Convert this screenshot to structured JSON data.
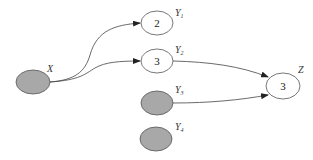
{
  "diagram": {
    "nodes": [
      {
        "id": "X",
        "label": "X",
        "sub": "",
        "value": "",
        "observed": true,
        "cx": 33,
        "cy": 82,
        "rx": 17,
        "ry": 12,
        "lx": 47,
        "ly": 72
      },
      {
        "id": "Y1",
        "label": "Y",
        "sub": "1",
        "value": "2",
        "observed": false,
        "cx": 157,
        "cy": 23,
        "rx": 16,
        "ry": 12,
        "lx": 175,
        "ly": 16
      },
      {
        "id": "Y2",
        "label": "Y",
        "sub": "2",
        "value": "3",
        "observed": false,
        "cx": 157,
        "cy": 61,
        "rx": 16,
        "ry": 12,
        "lx": 175,
        "ly": 53
      },
      {
        "id": "Y3",
        "label": "Y",
        "sub": "3",
        "value": "",
        "observed": true,
        "cx": 157,
        "cy": 103,
        "rx": 16,
        "ry": 12,
        "lx": 175,
        "ly": 93
      },
      {
        "id": "Y4",
        "label": "Y",
        "sub": "4",
        "value": "",
        "observed": true,
        "cx": 156,
        "cy": 139,
        "rx": 16,
        "ry": 12,
        "lx": 175,
        "ly": 130
      },
      {
        "id": "Z",
        "label": "Z",
        "sub": "",
        "value": "3",
        "observed": false,
        "cx": 283,
        "cy": 86,
        "rx": 17,
        "ry": 13,
        "lx": 298,
        "ly": 73
      }
    ],
    "edges": [
      {
        "from": "X",
        "to": "Y1"
      },
      {
        "from": "X",
        "to": "Y2"
      },
      {
        "from": "Y2",
        "to": "Z"
      },
      {
        "from": "Y3",
        "to": "Z"
      }
    ],
    "colors": {
      "observed_fill": "#a8a8a8",
      "unobserved_fill": "#ffffff",
      "stroke": "#555555",
      "edge": "#444444"
    }
  }
}
